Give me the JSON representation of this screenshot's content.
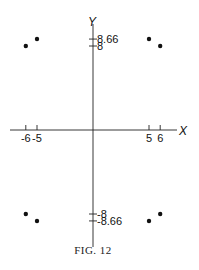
{
  "chart_data": {
    "type": "scatter",
    "title": "",
    "caption": "FIG. 12",
    "xlabel": "X",
    "ylabel": "Y",
    "x_ticks": [
      -6,
      -5,
      5,
      6
    ],
    "x_tick_labels": [
      "-6",
      "-5",
      "5",
      "6"
    ],
    "y_ticks": [
      8.66,
      8,
      -8,
      -8.66
    ],
    "y_tick_labels": [
      "8.66",
      "8",
      "-8",
      "-8.66"
    ],
    "grid": false,
    "series": [
      {
        "name": "points",
        "points": [
          {
            "x": -6,
            "y": 8
          },
          {
            "x": -5,
            "y": 8.66
          },
          {
            "x": 5,
            "y": 8.66
          },
          {
            "x": 6,
            "y": 8
          },
          {
            "x": -6,
            "y": -8
          },
          {
            "x": -5,
            "y": -8.66
          },
          {
            "x": 5,
            "y": -8.66
          },
          {
            "x": 6,
            "y": -8
          }
        ]
      }
    ]
  }
}
